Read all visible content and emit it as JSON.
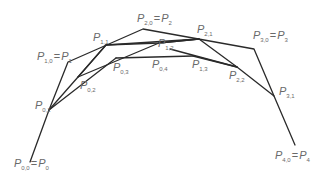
{
  "diagram": {
    "type": "de-casteljau-construction",
    "stroke_color": "#2a2a2a",
    "label_color": "#6a6a6a",
    "points": {
      "P00": {
        "x": 30,
        "y": 162
      },
      "P10": {
        "x": 68,
        "y": 62
      },
      "P20": {
        "x": 143,
        "y": 29
      },
      "P30": {
        "x": 254,
        "y": 49
      },
      "P40": {
        "x": 295,
        "y": 145
      },
      "P01": {
        "x": 49,
        "y": 110
      },
      "P11": {
        "x": 106,
        "y": 45
      },
      "P21": {
        "x": 199,
        "y": 39
      },
      "P31": {
        "x": 274,
        "y": 96
      },
      "P02": {
        "x": 78,
        "y": 77
      },
      "P12": {
        "x": 159,
        "y": 43
      },
      "P22": {
        "x": 237,
        "y": 67
      },
      "P03": {
        "x": 116,
        "y": 58
      },
      "P13": {
        "x": 193,
        "y": 56
      },
      "P04": {
        "x": 155,
        "y": 56
      }
    },
    "labels": [
      {
        "id": "P00",
        "main": "P",
        "sub": "0,0",
        "eq_main": "P",
        "eq_sub": "0",
        "x": 14,
        "y": 158
      },
      {
        "id": "P10",
        "main": "P",
        "sub": "1,0",
        "eq_main": "P",
        "eq_sub": "1",
        "x": 37,
        "y": 51
      },
      {
        "id": "P20",
        "main": "P",
        "sub": "2,0",
        "eq_main": "P",
        "eq_sub": "2",
        "x": 137,
        "y": 13
      },
      {
        "id": "P30",
        "main": "P",
        "sub": "3,0",
        "eq_main": "P",
        "eq_sub": "3",
        "x": 253,
        "y": 30
      },
      {
        "id": "P40",
        "main": "P",
        "sub": "4,0",
        "eq_main": "P",
        "eq_sub": "4",
        "x": 275,
        "y": 150
      },
      {
        "id": "P01",
        "main": "P",
        "sub": "0,1",
        "x": 35,
        "y": 100
      },
      {
        "id": "P11",
        "main": "P",
        "sub": "1,1",
        "x": 93,
        "y": 32
      },
      {
        "id": "P21",
        "main": "P",
        "sub": "2,1",
        "x": 197,
        "y": 24
      },
      {
        "id": "P31",
        "main": "P",
        "sub": "3,1",
        "x": 279,
        "y": 86
      },
      {
        "id": "P02",
        "main": "P",
        "sub": "0,2",
        "x": 80,
        "y": 80
      },
      {
        "id": "P12",
        "main": "P",
        "sub": "1,2",
        "x": 158,
        "y": 38
      },
      {
        "id": "P22",
        "main": "P",
        "sub": "2,2",
        "x": 229,
        "y": 70
      },
      {
        "id": "P03",
        "main": "P",
        "sub": "0,3",
        "x": 113,
        "y": 62
      },
      {
        "id": "P04",
        "main": "P",
        "sub": "0,4",
        "x": 152,
        "y": 59
      },
      {
        "id": "P13",
        "main": "P",
        "sub": "1,3",
        "x": 192,
        "y": 59
      }
    ]
  }
}
